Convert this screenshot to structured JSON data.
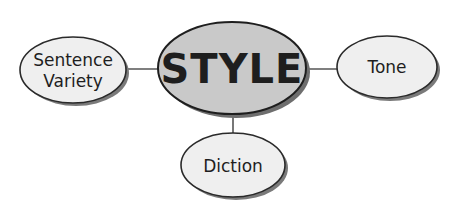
{
  "diagram": {
    "type": "concept-map",
    "center": {
      "label": "STYLE",
      "fill": "#c9c9c9",
      "cx": 232,
      "cy": 68,
      "rx": 74,
      "ry": 46
    },
    "nodes": [
      {
        "id": "sentence-variety",
        "lines": [
          "Sentence",
          "Variety"
        ],
        "fill": "#efefef",
        "cx": 73,
        "cy": 70,
        "rx": 53,
        "ry": 33
      },
      {
        "id": "tone",
        "lines": [
          "Tone"
        ],
        "fill": "#efefef",
        "cx": 387,
        "cy": 67,
        "rx": 50,
        "ry": 31
      },
      {
        "id": "diction",
        "lines": [
          "Diction"
        ],
        "fill": "#efefef",
        "cx": 233,
        "cy": 165,
        "rx": 52,
        "ry": 32
      }
    ],
    "edges": [
      {
        "from": "STYLE",
        "to": "Sentence Variety"
      },
      {
        "from": "STYLE",
        "to": "Tone"
      },
      {
        "from": "STYLE",
        "to": "Diction"
      }
    ],
    "colors": {
      "stroke": "#2a2a2a",
      "shadow": "#7a7a7a",
      "line": "#555555",
      "background": "#ffffff"
    }
  }
}
